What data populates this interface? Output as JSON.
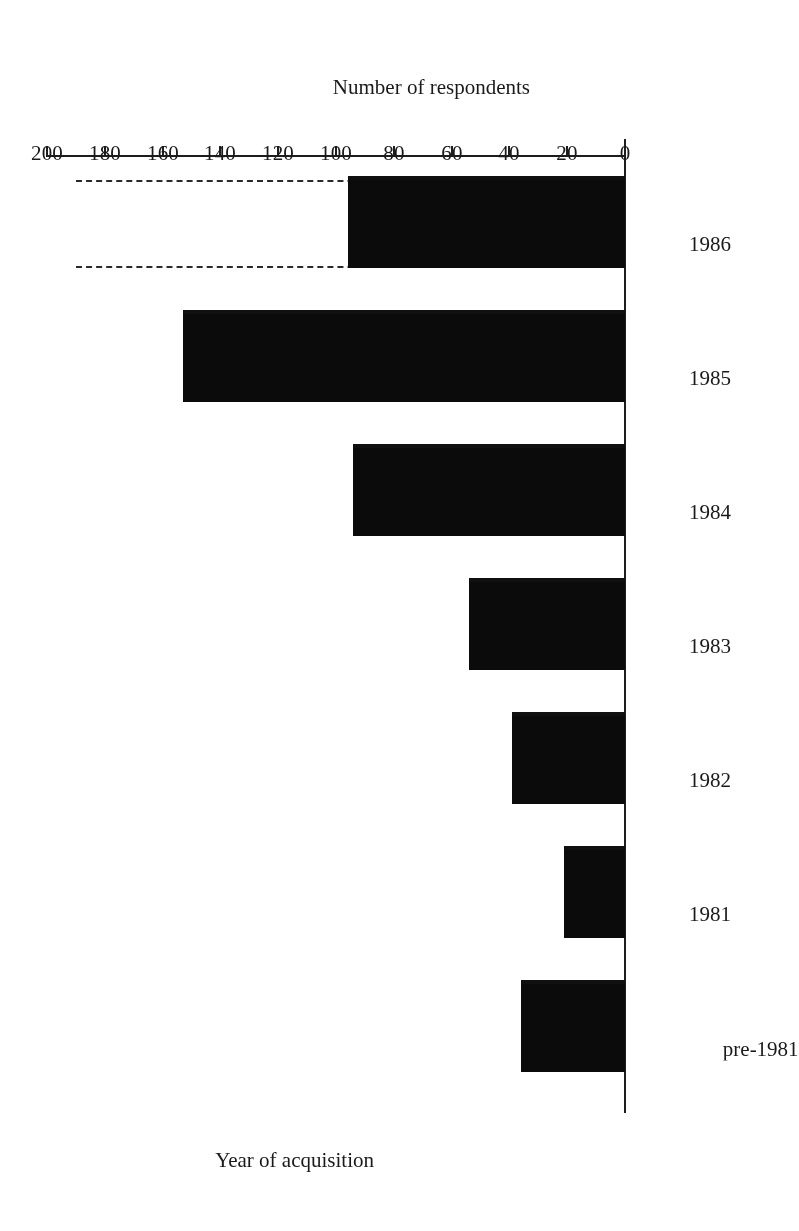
{
  "figure": {
    "orientation": "rotated-180",
    "background_color": "#ffffff",
    "bar_color": "#0b0b0b",
    "axis_color": "#1d1d1d"
  },
  "chart_data": {
    "type": "bar",
    "title": "",
    "xlabel": "Year of acquisition",
    "ylabel": "Number of respondents",
    "categories": [
      "pre-1981",
      "1981",
      "1982",
      "1983",
      "1984",
      "1985",
      "1986"
    ],
    "values": [
      36,
      21,
      39,
      54,
      94,
      153,
      96
    ],
    "projected": {
      "category": "1986",
      "value": 190,
      "style": "dashed-outline",
      "note": "dashed open extension beyond the solid 1986 bar"
    },
    "ylim": [
      0,
      200
    ],
    "ytick_values": [
      0,
      20,
      40,
      60,
      80,
      100,
      120,
      140,
      160,
      180,
      200
    ],
    "ytick_labels": [
      "0",
      "20",
      "40",
      "60",
      "80",
      "100",
      "120",
      "140",
      "160",
      "180",
      "200"
    ],
    "grid": false,
    "legend": null,
    "orientation": "horizontal-bars-rotated"
  }
}
